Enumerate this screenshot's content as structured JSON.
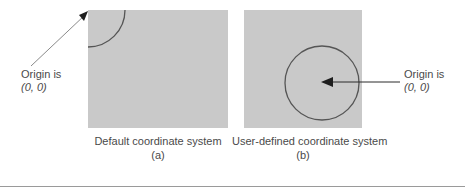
{
  "figure": {
    "panel_a": {
      "caption": "Default coordinate system",
      "sub_caption": "(a)",
      "shape": "quarter-arc-at-top-left-corner",
      "annotation": {
        "line1": "Origin is",
        "line2": "(0, 0)"
      }
    },
    "panel_b": {
      "caption": "User-defined coordinate system",
      "sub_caption": "(b)",
      "shape": "full-circle-centered-in-panel",
      "annotation": {
        "line1": "Origin is",
        "line2": "(0, 0)"
      }
    },
    "colors": {
      "panel_fill": "#c9c9c9",
      "stroke": "#555555",
      "text": "#4a4a4a",
      "rule": "#9a9a9a",
      "background": "#ffffff"
    }
  }
}
